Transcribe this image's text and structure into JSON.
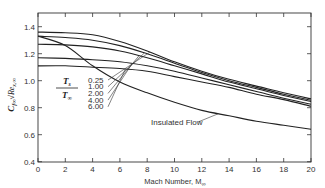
{
  "chart_data": {
    "type": "line",
    "title": "",
    "xlabel": "Mach Number, M∞",
    "ylabel": "C_f∞ √Re_x,∞",
    "xlim": [
      0,
      20
    ],
    "ylim": [
      0.4,
      1.45
    ],
    "x_ticks": [
      0,
      2,
      4,
      6,
      8,
      10,
      12,
      14,
      16,
      18,
      20
    ],
    "y_ticks": [
      0.4,
      0.6,
      0.8,
      1.0,
      1.2,
      1.4
    ],
    "y_tick_labels": [
      "0.4",
      "0.6",
      "0.8",
      "1.0",
      "1.2",
      "1.4"
    ],
    "grid": false,
    "legend_title": "T_s / T_∞",
    "x": [
      0,
      2,
      4,
      6,
      8,
      10,
      12,
      14,
      16,
      18,
      20
    ],
    "series": [
      {
        "name": "0.25",
        "values": [
          1.36,
          1.355,
          1.34,
          1.29,
          1.22,
          1.14,
          1.07,
          1.01,
          0.96,
          0.91,
          0.865
        ]
      },
      {
        "name": "1.00",
        "values": [
          1.33,
          1.32,
          1.3,
          1.26,
          1.2,
          1.13,
          1.06,
          1.0,
          0.95,
          0.9,
          0.855
        ]
      },
      {
        "name": "2.00",
        "values": [
          1.27,
          1.265,
          1.25,
          1.22,
          1.17,
          1.11,
          1.05,
          0.99,
          0.94,
          0.89,
          0.845
        ]
      },
      {
        "name": "4.00",
        "values": [
          1.17,
          1.165,
          1.155,
          1.14,
          1.11,
          1.07,
          1.02,
          0.97,
          0.92,
          0.87,
          0.825
        ]
      },
      {
        "name": "6.00",
        "values": [
          1.11,
          1.11,
          1.1,
          1.09,
          1.07,
          1.03,
          0.99,
          0.95,
          0.9,
          0.86,
          0.81
        ]
      },
      {
        "name": "Insulated Flow",
        "values": [
          1.33,
          1.26,
          1.11,
          0.99,
          0.91,
          0.84,
          0.78,
          0.74,
          0.7,
          0.67,
          0.64
        ]
      }
    ],
    "annotations": [
      {
        "text": "Insulated Flow",
        "target_series": "Insulated Flow"
      },
      {
        "text": "T_s / T_∞",
        "role": "parameter label"
      }
    ]
  },
  "labels": {
    "xaxis_title": "Mach Number, M",
    "xaxis_sub": "∞",
    "yaxis_C": "C",
    "yaxis_sub": "f∞",
    "yaxis_root": "√Re",
    "yaxis_root_sub": "x,∞",
    "frac_num": "T",
    "frac_num_sub": "s",
    "frac_den": "T",
    "frac_den_sub": "∞",
    "insulated": "Insulated Flow"
  }
}
